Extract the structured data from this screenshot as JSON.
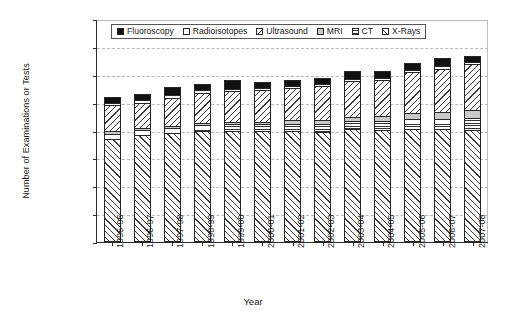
{
  "chart_data": {
    "type": "bar",
    "stacked": true,
    "title": "",
    "xlabel": "Year",
    "ylabel": "Number of Examinations or Tests",
    "ylim": [
      0,
      40000000
    ],
    "ytick_step": 5000000,
    "ytick_labels": [
      "0",
      "5 000 000",
      "10 000 000",
      "15 000 000",
      "20 000 000",
      "25 000 000",
      "30 000 000",
      "35 000 000",
      "40 000 000"
    ],
    "ytick_values": [
      0,
      5000000,
      10000000,
      15000000,
      20000000,
      25000000,
      30000000,
      35000000,
      40000000
    ],
    "grid": true,
    "legend_position": "top-inside",
    "categories": [
      "1995-96",
      "1996-97",
      "1997-98",
      "1998-99",
      "1999-00",
      "2000-01",
      "2001-02",
      "2002-03",
      "2003-04",
      "2004-05",
      "2005-06",
      "2006-07",
      "2007-08"
    ],
    "series": [
      {
        "name": "X-Rays",
        "pattern": "diagonal-forward-hatch",
        "values": [
          18400000,
          19200000,
          19500000,
          20000000,
          20000000,
          20000000,
          19900000,
          19800000,
          20200000,
          20100000,
          20300000,
          20200000,
          20100000
        ]
      },
      {
        "name": "CT",
        "pattern": "horizontal-lines",
        "values": [
          900000,
          900000,
          1000000,
          1000000,
          1100000,
          1100000,
          1300000,
          1400000,
          1500000,
          1600000,
          1800000,
          1900000,
          2100000
        ]
      },
      {
        "name": "MRI",
        "pattern": "solid-gray",
        "values": [
          700000,
          400000,
          400000,
          400000,
          500000,
          500000,
          600000,
          700000,
          800000,
          900000,
          1000000,
          1200000,
          1400000
        ]
      },
      {
        "name": "Ultrasound",
        "pattern": "diagonal-back-hatch",
        "values": [
          4600000,
          4500000,
          5000000,
          5400000,
          5500000,
          5600000,
          5800000,
          6100000,
          6400000,
          6500000,
          7400000,
          7800000,
          8300000
        ]
      },
      {
        "name": "Radioisotopes",
        "pattern": "white-empty",
        "values": [
          400000,
          400000,
          400000,
          400000,
          400000,
          400000,
          400000,
          400000,
          400000,
          400000,
          400000,
          400000,
          400000
        ]
      },
      {
        "name": "Fluoroscopy",
        "pattern": "solid-black",
        "values": [
          1100000,
          1100000,
          1600000,
          1100000,
          1600000,
          1100000,
          1100000,
          1100000,
          1300000,
          1100000,
          1200000,
          1600000,
          1100000
        ]
      }
    ],
    "totals": [
      26100000,
      26500000,
      27900000,
      28300000,
      29100000,
      28700000,
      29100000,
      29500000,
      30600000,
      30600000,
      32100000,
      33100000,
      33500000
    ]
  },
  "legend": {
    "items": [
      {
        "label": "Fluoroscopy",
        "swatch": "solid-black-swatch"
      },
      {
        "label": "Radioisotopes",
        "swatch": "white-empty-swatch"
      },
      {
        "label": "Ultrasound",
        "swatch": "diagonal-back-hatch-swatch"
      },
      {
        "label": "MRI",
        "swatch": "solid-gray-swatch"
      },
      {
        "label": "CT",
        "swatch": "horizontal-lines-swatch"
      },
      {
        "label": "X-Rays",
        "swatch": "diagonal-forward-hatch-swatch"
      }
    ]
  }
}
